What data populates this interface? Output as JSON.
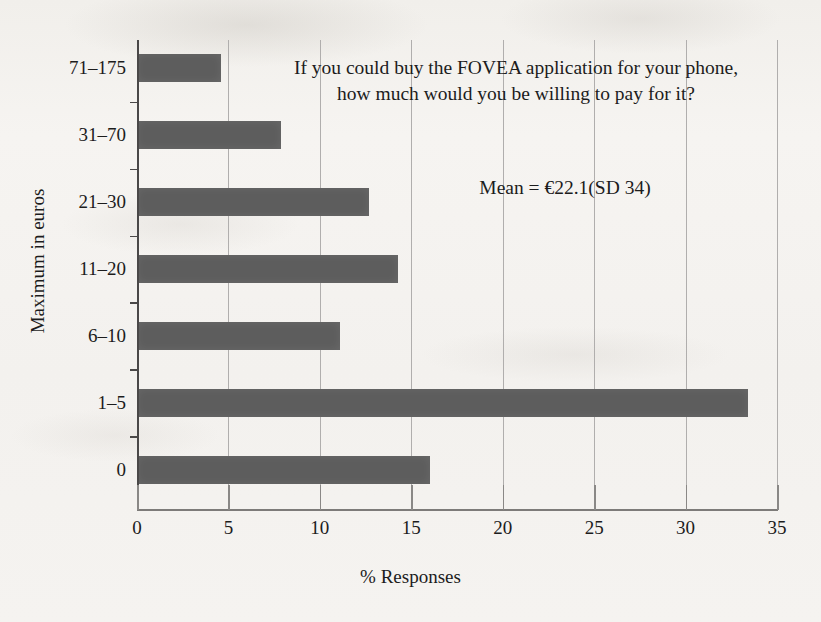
{
  "chart_data": {
    "type": "bar",
    "orientation": "horizontal",
    "title": "If you could buy the FOVEA application for your phone, how much would you be willing to pay for it?",
    "title_line1": "If you could buy the FOVEA application for your phone,",
    "title_line2": "how much would you be willing to pay for it?",
    "annotation": "Mean = €22.1(SD 34)",
    "xlabel": "% Responses",
    "ylabel": "Maximum in euros",
    "xlim": [
      0,
      35
    ],
    "ylim": null,
    "grid": true,
    "legend": null,
    "bar_color": "#5d5d5d",
    "background_color": "#f4f2ef",
    "axis_color": "#4a4848",
    "gridline_color": "#b0aead",
    "xticks": [
      0,
      5,
      10,
      15,
      20,
      25,
      30,
      35
    ],
    "xtick_labels": [
      "0",
      "5",
      "10",
      "15",
      "20",
      "25",
      "30",
      "35"
    ],
    "categories": [
      "71–175",
      "31–70",
      "21–30",
      "11–20",
      "6–10",
      "1–5",
      "0"
    ],
    "values": [
      4.6,
      7.9,
      12.7,
      14.3,
      11.1,
      33.4,
      16.0
    ],
    "bars": [
      {
        "category": "71–175",
        "value": 4.6
      },
      {
        "category": "31–70",
        "value": 7.9
      },
      {
        "category": "21–30",
        "value": 12.7
      },
      {
        "category": "11–20",
        "value": 14.3
      },
      {
        "category": "6–10",
        "value": 11.1
      },
      {
        "category": "1–5",
        "value": 33.4
      },
      {
        "category": "0",
        "value": 16.0
      }
    ]
  }
}
